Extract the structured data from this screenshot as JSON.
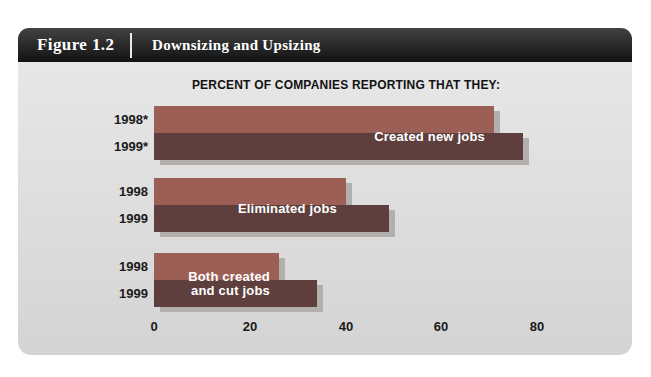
{
  "figure": {
    "number": "Figure 1.2",
    "title": "Downsizing and Upsizing"
  },
  "chart_data": {
    "type": "bar",
    "orientation": "horizontal",
    "title": "PERCENT OF COMPANIES REPORTING THAT THEY:",
    "xlabel": "",
    "ylabel": "",
    "x_ticks": [
      0,
      20,
      40,
      60,
      80
    ],
    "xlim": [
      0,
      88
    ],
    "grid": false,
    "legend_position": "labels-on-bars",
    "categories": [
      "Created new jobs",
      "Eliminated jobs",
      "Both created and cut jobs"
    ],
    "series": [
      {
        "name": "1998",
        "values": [
          71,
          40,
          26
        ]
      },
      {
        "name": "1999",
        "values": [
          77,
          49,
          34
        ]
      }
    ],
    "groups": [
      {
        "label": "Created new jobs",
        "rows": [
          {
            "year": "1998*",
            "value": 71
          },
          {
            "year": "1999*",
            "value": 77
          }
        ]
      },
      {
        "label": "Eliminated jobs",
        "rows": [
          {
            "year": "1998",
            "value": 40
          },
          {
            "year": "1999",
            "value": 49
          }
        ]
      },
      {
        "label": "Both created\nand cut jobs",
        "rows": [
          {
            "year": "1998",
            "value": 26
          },
          {
            "year": "1999",
            "value": 34
          }
        ]
      }
    ],
    "colors": {
      "bar_1998": "#9c5f56",
      "bar_1999": "#5e3f3d",
      "bar_shadow": "#b2afac",
      "bar_label_text": "#ffffff",
      "header_bg": "#1c1c1c",
      "header_text": "#ffffff",
      "body_bg_top": "#e7e7e7",
      "body_bg_bottom": "#d4d4d4",
      "axis_text": "#1a1a1a"
    }
  }
}
